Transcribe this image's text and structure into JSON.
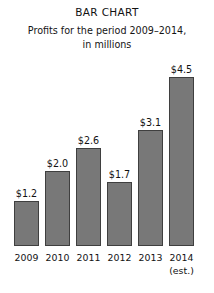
{
  "chart_data": {
    "type": "bar",
    "title": "BAR CHART",
    "subtitle_line1": "Profits for the period 2009–2014,",
    "subtitle_line2": "in millions",
    "xlabel": "",
    "ylabel": "",
    "ylim": [
      0,
      5
    ],
    "grid": false,
    "legend": false,
    "categories": [
      "2009",
      "2010",
      "2011",
      "2012",
      "2013",
      "2014"
    ],
    "values": [
      1.2,
      2.0,
      2.6,
      1.7,
      3.1,
      4.5
    ],
    "value_labels": [
      "$1.2",
      "$2.0",
      "$2.6",
      "$1.7",
      "$3.1",
      "$4.5"
    ],
    "annotations": [
      {
        "category": "2014",
        "text": "(est.)"
      }
    ],
    "bar_color": "#787878",
    "bar_border_color": "#3f3f3f",
    "text_color": "#121212",
    "background": "#ffffff"
  },
  "figure": {
    "bars": [
      {
        "category": "2009",
        "value_label": "$1.2",
        "note": ""
      },
      {
        "category": "2010",
        "value_label": "$2.0",
        "note": ""
      },
      {
        "category": "2011",
        "value_label": "$2.6",
        "note": ""
      },
      {
        "category": "2012",
        "value_label": "$1.7",
        "note": ""
      },
      {
        "category": "2013",
        "value_label": "$3.1",
        "note": ""
      },
      {
        "category": "2014",
        "value_label": "$4.5",
        "note": "(est.)"
      }
    ]
  }
}
